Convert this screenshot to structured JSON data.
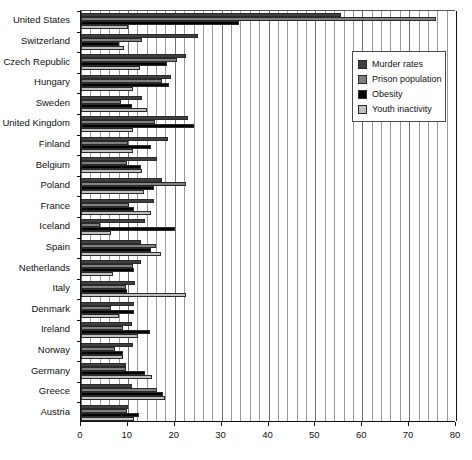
{
  "chart_data": {
    "type": "bar",
    "orientation": "horizontal",
    "title": "",
    "xlabel": "",
    "ylabel": "",
    "xlim": [
      0,
      80
    ],
    "xticks": [
      0,
      10,
      20,
      30,
      40,
      50,
      60,
      70,
      80
    ],
    "xtick_labels": [
      "0",
      "10",
      "20",
      "30",
      "40",
      "50",
      "60",
      "70",
      "80"
    ],
    "minor_tick_step": 2,
    "grid": true,
    "grid_axis": "x",
    "legend_position": "upper right",
    "categories": [
      "United States",
      "Switzerland",
      "Czech Republic",
      "Hungary",
      "Sweden",
      "United Kingdom",
      "Finland",
      "Belgium",
      "Poland",
      "France",
      "Iceland",
      "Spain",
      "Netherlands",
      "Italy",
      "Denmark",
      "Ireland",
      "Norway",
      "Germany",
      "Greece",
      "Austria"
    ],
    "series": [
      {
        "name": "Murder rates",
        "color": "#404040",
        "values": [
          55.5,
          24.9,
          22.3,
          19.2,
          13.0,
          22.8,
          18.5,
          16.2,
          17.2,
          15.6,
          13.6,
          12.9,
          12.8,
          11.5,
          11.2,
          10.8,
          11.0,
          9.6,
          10.9,
          10.1
        ]
      },
      {
        "name": "Prison population",
        "color": "#808080",
        "values": [
          75.7,
          13.0,
          20.5,
          17.2,
          8.6,
          15.7,
          10.0,
          9.8,
          22.4,
          10.3,
          4.0,
          15.9,
          11.1,
          9.7,
          6.5,
          8.9,
          7.3,
          9.5,
          16.3,
          9.9
        ]
      },
      {
        "name": "Obesity",
        "color": "#000000",
        "values": [
          33.8,
          8.1,
          18.3,
          18.8,
          10.9,
          24.0,
          15.0,
          12.7,
          15.5,
          11.2,
          20.0,
          14.9,
          11.4,
          9.9,
          11.3,
          14.8,
          9.0,
          13.6,
          17.5,
          12.3
        ]
      },
      {
        "name": "Youth inactivity",
        "color": "#c0c0c0",
        "values": [
          10.0,
          9.2,
          12.6,
          11.0,
          14.0,
          11.0,
          11.0,
          13.0,
          13.4,
          14.9,
          6.3,
          17.0,
          6.9,
          22.3,
          8.0,
          12.1,
          9.0,
          15.2,
          18.0,
          11.2
        ]
      }
    ]
  },
  "legend": {
    "items": [
      {
        "label": "Murder rates",
        "color": "#404040"
      },
      {
        "label": "Prison population",
        "color": "#808080"
      },
      {
        "label": "Obesity",
        "color": "#000000"
      },
      {
        "label": "Youth inactivity",
        "color": "#c0c0c0"
      }
    ]
  }
}
